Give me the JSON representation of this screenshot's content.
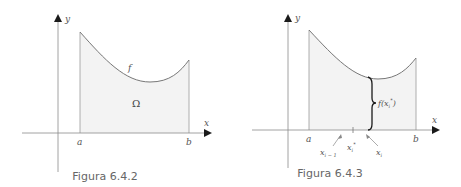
{
  "figures": [
    {
      "caption": "Figura  6.4.2",
      "x_axis_label": "x",
      "y_axis_label": "y",
      "a_label": "a",
      "b_label": "b",
      "function_label": "f",
      "region_label": "Ω"
    },
    {
      "caption": "Figura  6.4.3",
      "x_axis_label": "x",
      "y_axis_label": "y",
      "a_label": "a",
      "b_label": "b",
      "height_label": "f(x",
      "height_label_sub": "i",
      "height_label_sup": "*",
      "height_label_close": ")",
      "x_prev_label": "x",
      "x_prev_sub": "i − 1",
      "x_star_label": "x",
      "x_star_sub": "i",
      "x_star_sup": "*",
      "x_i_label": "x",
      "x_i_sub": "i"
    }
  ],
  "colors": {
    "axis": "#7a7a7a",
    "curve": "#777777",
    "fill": "#f3f3f3",
    "arrowhead": "#1a1a1a",
    "text": "#555555"
  }
}
